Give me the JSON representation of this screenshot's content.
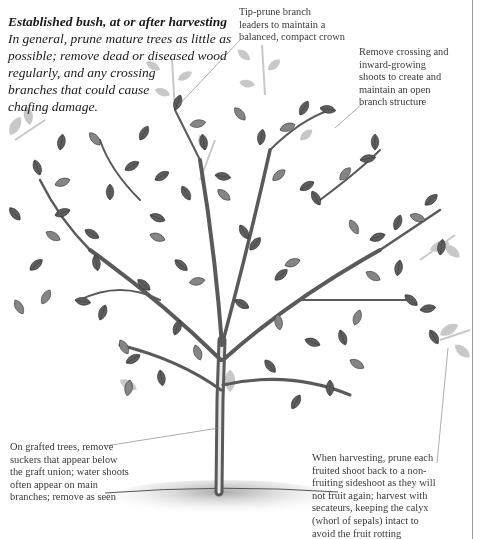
{
  "heading": {
    "title": "Established bush, at or after harvesting",
    "intro_lines": [
      "In general, prune mature trees as little as",
      "possible; remove dead or diseased wood",
      "regularly, and any crossing",
      "branches that could cause",
      "chafing damage."
    ]
  },
  "callouts": {
    "tip_prune": {
      "lines": [
        "Tip-prune branch",
        "leaders to maintain a",
        "balanced, compact crown"
      ]
    },
    "crossing": {
      "lines": [
        "Remove crossing and",
        "inward-growing",
        "shoots to create and",
        "maintain an open",
        "branch structure"
      ]
    },
    "grafted": {
      "lines": [
        "On grafted trees, remove",
        "suckers that appear below",
        "the graft union; water shoots",
        "often appear on main",
        "branches; remove as seen"
      ]
    },
    "harvesting": {
      "lines": [
        "When harvesting, prune each",
        "fruited shoot back to a non-",
        "fruiting sideshoot as they will",
        "not fruit again; harvest with",
        "secateurs, keeping the calyx",
        "(whorl of sepals) intact to",
        "avoid the fruit rotting"
      ]
    }
  },
  "illustration": {
    "subject": "pruned-fruit-tree-illustration",
    "colors": {
      "leaf_dark": "#5a5a5a",
      "leaf_mid": "#7d7d7d",
      "leaf_ghost": "#c4c4c4",
      "branch": "#6b6b6b",
      "ground": "#b5b5b5",
      "leader_line": "#8a8a8a",
      "page_edge": "#9a9a9a"
    }
  }
}
